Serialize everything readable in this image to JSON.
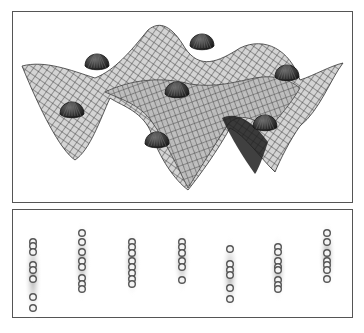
{
  "figure": {
    "top_panel": {
      "description": "3D sinusoidal potential surface (wire-mesh) with dome-shaped particles resting in wells",
      "surface_color": "#cfcfcf",
      "mesh_color": "#3a3a3a",
      "dome_color": "#2a2a2a",
      "domes": [
        {
          "x": 97,
          "y": 62
        },
        {
          "x": 202,
          "y": 42
        },
        {
          "x": 177,
          "y": 90
        },
        {
          "x": 287,
          "y": 73
        },
        {
          "x": 72,
          "y": 110
        },
        {
          "x": 157,
          "y": 140
        },
        {
          "x": 265,
          "y": 123
        }
      ]
    },
    "bottom_panel": {
      "description": "Seven vertical chains of ring-shaped particles with grey halo channels",
      "ring_color": "#555555",
      "halo_color": "#9a9a9a",
      "columns": [
        {
          "x": 33,
          "rings": [
            242,
            246,
            252,
            265,
            270,
            279,
            297,
            308
          ]
        },
        {
          "x": 82,
          "rings": [
            233,
            242,
            252,
            261,
            267,
            278,
            284,
            289
          ]
        },
        {
          "x": 132,
          "rings": [
            242,
            247,
            253,
            261,
            267,
            273,
            279,
            284
          ]
        },
        {
          "x": 182,
          "rings": [
            242,
            247,
            253,
            261,
            267,
            280
          ]
        },
        {
          "x": 230,
          "rings": [
            249,
            264,
            270,
            275,
            288,
            299
          ]
        },
        {
          "x": 278,
          "rings": [
            247,
            252,
            261,
            267,
            270,
            280,
            285,
            289
          ]
        },
        {
          "x": 327,
          "rings": [
            233,
            242,
            253,
            261,
            265,
            270,
            279
          ]
        }
      ]
    }
  }
}
